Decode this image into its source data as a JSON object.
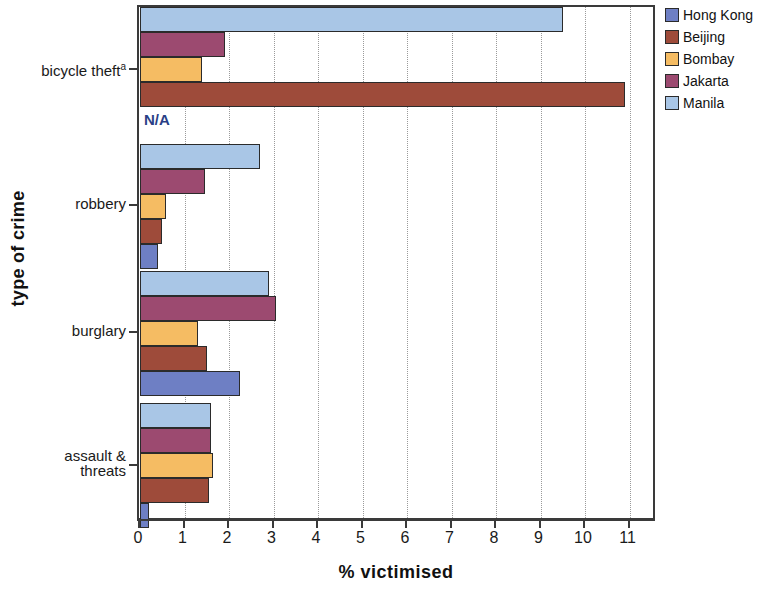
{
  "chart_data": {
    "type": "bar",
    "orientation": "horizontal",
    "title": "",
    "xlabel": "% victimised",
    "ylabel": "type of crime",
    "xlim": [
      0,
      11.4
    ],
    "xticks": [
      0,
      1,
      2,
      3,
      4,
      5,
      6,
      7,
      8,
      9,
      10,
      11
    ],
    "grid": "vertical-dotted",
    "legend_position": "right",
    "categories": [
      "bicycle theft",
      "robbery",
      "burglary",
      "assault & threats"
    ],
    "category_labels": [
      "bicycle theft",
      "robbery",
      "burglary",
      "assault &\nthreats"
    ],
    "category_footnotes": [
      "a",
      "",
      "",
      ""
    ],
    "series": [
      {
        "name": "Hong Kong",
        "color": "#6E7FC4",
        "values": [
          null,
          0.4,
          2.25,
          0.2
        ]
      },
      {
        "name": "Beijing",
        "color": "#9E4B3A",
        "values": [
          10.9,
          0.5,
          1.5,
          1.55
        ]
      },
      {
        "name": "Bombay",
        "color": "#F5BC63",
        "values": [
          1.4,
          0.58,
          1.3,
          1.65
        ]
      },
      {
        "name": "Jakarta",
        "color": "#9C4A70",
        "values": [
          1.9,
          1.45,
          3.05,
          1.6
        ]
      },
      {
        "name": "Manila",
        "color": "#A9C6E6",
        "values": [
          9.5,
          2.7,
          2.9,
          1.6
        ]
      }
    ],
    "annotations": [
      {
        "text": "N/A",
        "category": "bicycle theft",
        "series": "Hong Kong",
        "color": "#2a3f86"
      }
    ]
  },
  "legend": {
    "items": [
      {
        "label": "Hong Kong",
        "color": "#6E7FC4"
      },
      {
        "label": "Beijing",
        "color": "#9E4B3A"
      },
      {
        "label": "Bombay",
        "color": "#F5BC63"
      },
      {
        "label": "Jakarta",
        "color": "#9C4A70"
      },
      {
        "label": "Manila",
        "color": "#A9C6E6"
      }
    ]
  },
  "axes": {
    "x_title": "% victimised",
    "y_title": "type of crime",
    "x_ticklabels": [
      "0",
      "1",
      "2",
      "3",
      "4",
      "5",
      "6",
      "7",
      "8",
      "9",
      "10",
      "11"
    ]
  }
}
